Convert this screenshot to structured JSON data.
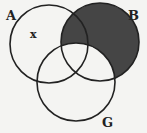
{
  "diagram": {
    "type": "venn",
    "sets": [
      {
        "label": "A",
        "cx": 49,
        "cy": 44,
        "r": 39
      },
      {
        "label": "B",
        "cx": 100,
        "cy": 42,
        "r": 39
      },
      {
        "label": "G",
        "cx": 76,
        "cy": 82,
        "r": 39
      }
    ],
    "shaded_region": "B minus G",
    "shade_color": "#444444",
    "stroke_color": "#222222",
    "annotations": [
      {
        "text": "x",
        "region": "A only"
      }
    ],
    "labels": {
      "a": "A",
      "b": "B",
      "g": "G",
      "x": "x"
    }
  }
}
